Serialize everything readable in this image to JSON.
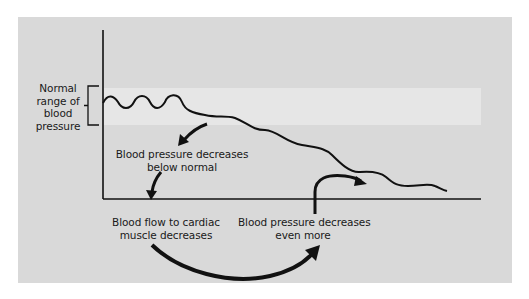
{
  "diagram": {
    "labels": {
      "normal_range": "Normal range of blood pressure",
      "normal_range_lines": [
        "Normal",
        "range of",
        "blood",
        "pressure"
      ],
      "decrease_below": [
        "Blood pressure decreases",
        "below normal"
      ],
      "blood_flow": [
        "Blood flow to cardiac",
        "muscle decreases"
      ],
      "decrease_more": [
        "Blood pressure decreases",
        "even more"
      ]
    },
    "colors": {
      "panel": "#d9d9d9",
      "normal_band": "#e6e6e6",
      "ink": "#111111",
      "background": "#ffffff"
    },
    "flow": [
      "Blood pressure decreases below normal",
      "Blood flow to cardiac muscle decreases",
      "Blood pressure decreases even more"
    ]
  }
}
